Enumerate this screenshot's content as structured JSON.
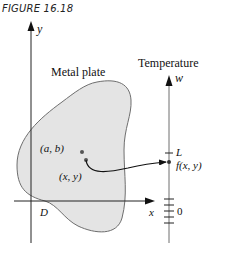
{
  "figure": {
    "label": "FIGURE 16.18"
  },
  "left_plot": {
    "y_axis_label": "y",
    "x_axis_label": "x",
    "region_label": "Metal plate",
    "domain_label": "D",
    "point_ab_label": "(a, b)",
    "point_xy_label": "(x, y)"
  },
  "right_axis": {
    "title": "Temperature",
    "axis_label": "w",
    "limit_label": "L",
    "value_label": "f(x, y)",
    "zero_label": "0"
  },
  "colors": {
    "plate_fill": "#e4e4e4",
    "stroke": "#222222",
    "outline": "#6e6e6e"
  }
}
